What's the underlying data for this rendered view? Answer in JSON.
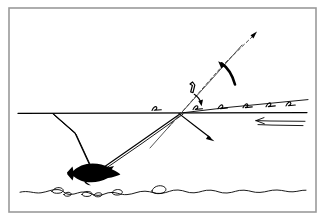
{
  "figure": {
    "title": "Refraction and reflection of light at a water surface with fish below",
    "background_color": "#ffffff",
    "ink_color": "#000000",
    "frame_color": "#9a9a9a",
    "width": 325,
    "height": 220,
    "style": "hand-drawn line diagram"
  },
  "elements": {
    "frame_label": "diagram border",
    "water_surface_label": "water surface line",
    "sloped_surface_label": "sloped water surface line",
    "incident_ray_label": "incident ray from fish to surface",
    "refracted_ray_label": "refracted ray leaving surface upward",
    "reflected_ray_label": "reflected ray going down-right",
    "apparent_ray_label": "apparent line of sight from surface down-left",
    "dashed_ray_label": "dashed extension ray to upper right",
    "curved_arrow_label": "curved arrow indicating ray rotation",
    "angle_marker_label": "small angle bracket marker",
    "small_curved_arrow_label": "small curved arrow at angle marker",
    "current_arrow_label": "leftward arrow below surface indicating current",
    "fish_label": "fish silhouette",
    "lakebed_label": "wavy lake bed with pebbles",
    "wave_marks_label": "surface wave tick marks"
  },
  "geometry": {
    "surface_y": 113,
    "surface_x_start": 18,
    "surface_x_end": 307,
    "vertex_x": 181,
    "vertex_y": 113,
    "fish_x": 92,
    "fish_y": 172,
    "dashed_tip_x": 256,
    "dashed_tip_y": 33,
    "reflected_tip_x": 213,
    "reflected_tip_y": 140,
    "left_ray_origin_x": 53,
    "left_ray_origin_y": 113
  },
  "wave_marks": {
    "count": 6,
    "x_positions": [
      156,
      197,
      222,
      247,
      270,
      290
    ],
    "y_positions": [
      106,
      105,
      105,
      104,
      104,
      103
    ]
  },
  "pebbles": {
    "count": 6,
    "x_positions": [
      55,
      66,
      86,
      98,
      118,
      160
    ],
    "y_positions": [
      192,
      195,
      193,
      194,
      191,
      190
    ]
  }
}
